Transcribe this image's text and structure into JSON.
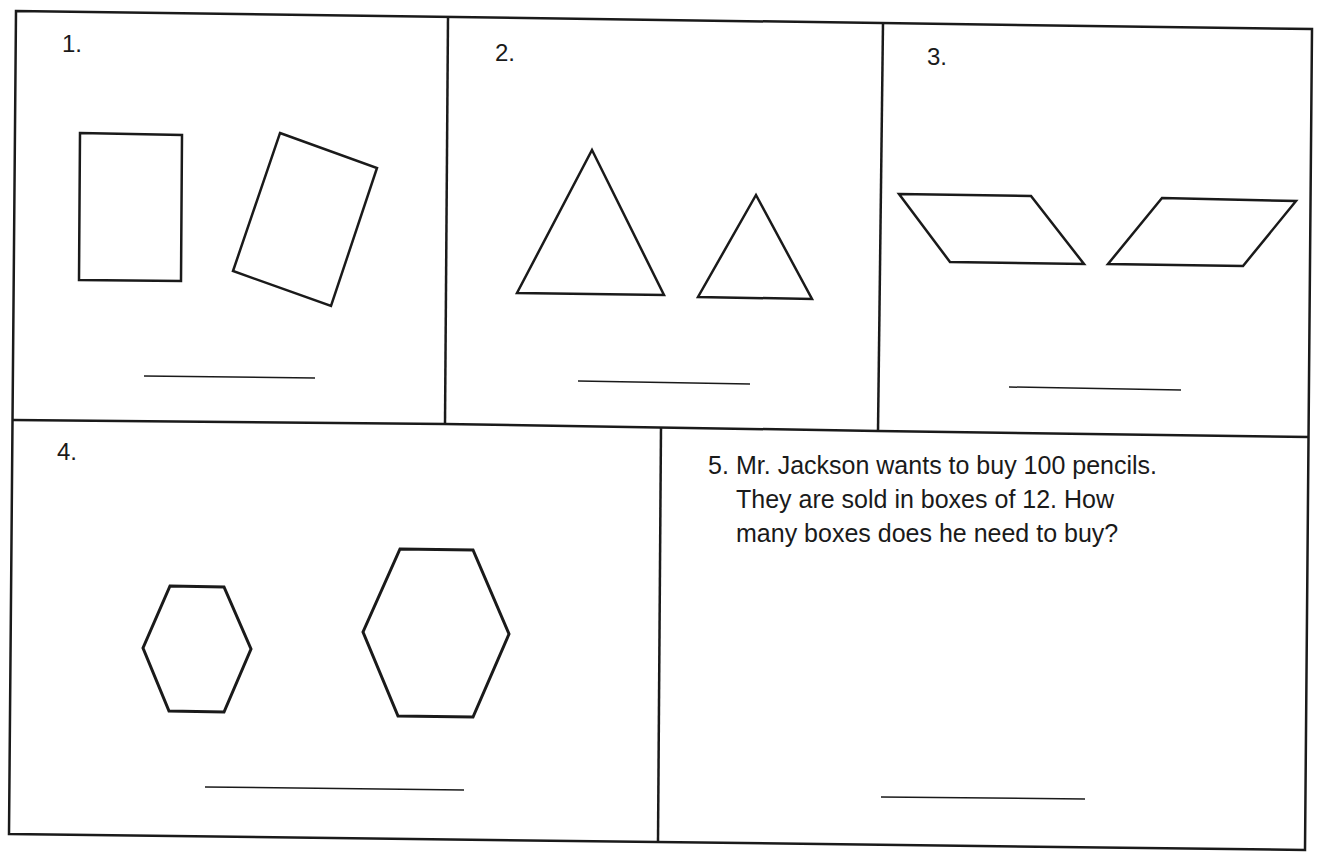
{
  "worksheet": {
    "problems": [
      {
        "number": "1.",
        "shapes": "two rectangles (one upright, one rotated)"
      },
      {
        "number": "2.",
        "shapes": "two triangles (large and small)"
      },
      {
        "number": "3.",
        "shapes": "two parallelograms (mirrored)"
      },
      {
        "number": "4.",
        "shapes": "two hexagons (small and large)"
      },
      {
        "number": "5.",
        "lines": [
          "Mr. Jackson wants to buy 100 pencils.",
          "They are sold in boxes of 12.  How",
          "many boxes does he need to buy?"
        ]
      }
    ],
    "answer_line_count": 5
  },
  "colors": {
    "ink": "#1a1a1a",
    "paper": "#ffffff"
  }
}
